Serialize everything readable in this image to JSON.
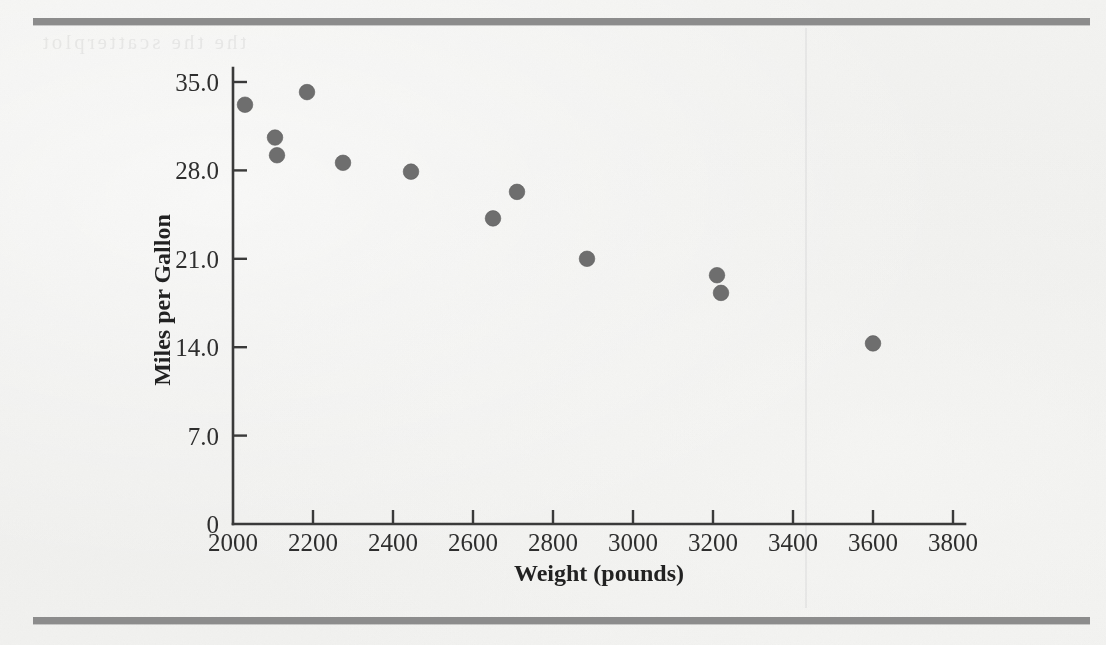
{
  "figure": {
    "background_color": "#f1f1ef",
    "rule_color": "#8c8c8c",
    "point_color": "#6e6e6e",
    "axis_color": "#3a3a3a",
    "ghost_text": "the the scatterplot"
  },
  "chart_data": {
    "type": "scatter",
    "title": "",
    "xlabel": "Weight (pounds)",
    "ylabel": "Miles per Gallon",
    "xlim": [
      2000,
      3800
    ],
    "ylim": [
      0,
      35
    ],
    "grid": false,
    "legend": null,
    "xticks": [
      2000,
      2200,
      2400,
      2600,
      2800,
      3000,
      3200,
      3400,
      3600,
      3800
    ],
    "xticklabels": [
      "2000",
      "2200",
      "2400",
      "2600",
      "2800",
      "3000",
      "3200",
      "3400",
      "3600",
      "3800"
    ],
    "yticks": [
      0,
      7,
      14,
      21,
      28,
      35
    ],
    "yticklabels": [
      "0",
      "7.0",
      "14.0",
      "21.0",
      "28.0",
      "35.0"
    ],
    "series": [
      {
        "name": "cars",
        "marker": "circle",
        "color": "#6e6e6e",
        "x": [
          2030,
          2105,
          2110,
          2185,
          2275,
          2445,
          2650,
          2710,
          2885,
          3210,
          3220,
          3600
        ],
        "y": [
          33.2,
          30.6,
          29.2,
          34.2,
          28.6,
          27.9,
          24.2,
          26.3,
          21.0,
          19.7,
          18.3,
          14.3
        ],
        "points": [
          {
            "weight": 2030,
            "mpg": 33.2
          },
          {
            "weight": 2105,
            "mpg": 30.6
          },
          {
            "weight": 2110,
            "mpg": 29.2
          },
          {
            "weight": 2185,
            "mpg": 34.2
          },
          {
            "weight": 2275,
            "mpg": 28.6
          },
          {
            "weight": 2445,
            "mpg": 27.9
          },
          {
            "weight": 2650,
            "mpg": 24.2
          },
          {
            "weight": 2710,
            "mpg": 26.3
          },
          {
            "weight": 2885,
            "mpg": 21.0
          },
          {
            "weight": 3210,
            "mpg": 19.7
          },
          {
            "weight": 3220,
            "mpg": 18.3
          },
          {
            "weight": 3600,
            "mpg": 14.3
          }
        ]
      }
    ]
  },
  "axes": {
    "x_title": "Weight (pounds)",
    "y_title": "Miles per Gallon"
  }
}
